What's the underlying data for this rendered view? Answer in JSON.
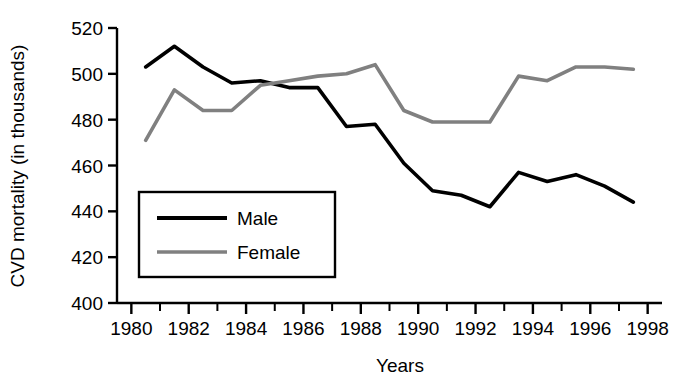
{
  "chart_data": {
    "type": "line",
    "title": "",
    "xlabel": "Years",
    "ylabel": "CVD mortality (in thousands)",
    "xlim": [
      1979.5,
      1998.5
    ],
    "ylim": [
      400,
      520
    ],
    "xticks": [
      1980,
      1982,
      1984,
      1986,
      1988,
      1990,
      1992,
      1994,
      1996,
      1998
    ],
    "xtick_labels": [
      "1980",
      "1982",
      "1984",
      "1986",
      "1988",
      "1990",
      "1992",
      "1994",
      "1996",
      "1998"
    ],
    "xminor_ticks": [
      1981,
      1983,
      1985,
      1987,
      1989,
      1991,
      1993,
      1995,
      1997
    ],
    "yticks": [
      400,
      420,
      440,
      460,
      480,
      500,
      520
    ],
    "ytick_labels": [
      "400",
      "420",
      "440",
      "460",
      "480",
      "500",
      "520"
    ],
    "grid": false,
    "legend_position": "lower-left-inside",
    "x": [
      1980.5,
      1981.5,
      1982.5,
      1983.5,
      1984.5,
      1985.5,
      1986.5,
      1987.5,
      1988.5,
      1989.5,
      1990.5,
      1991.5,
      1992.5,
      1993.5,
      1994.5,
      1995.5,
      1996.5,
      1997.5
    ],
    "series": [
      {
        "name": "Male",
        "color": "#000000",
        "values": [
          503,
          512,
          503,
          496,
          497,
          494,
          494,
          477,
          478,
          461,
          449,
          447,
          442,
          457,
          453,
          456,
          451,
          444
        ]
      },
      {
        "name": "Female",
        "color": "#808080",
        "values": [
          471,
          493,
          484,
          484,
          495,
          497,
          499,
          500,
          504,
          484,
          479,
          479,
          479,
          499,
          497,
          503,
          503,
          502
        ]
      }
    ]
  },
  "legend": {
    "items": [
      {
        "label": "Male",
        "color": "#000000"
      },
      {
        "label": "Female",
        "color": "#808080"
      }
    ]
  }
}
